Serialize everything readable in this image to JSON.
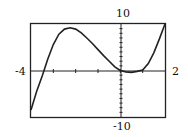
{
  "chart_data": {
    "type": "line",
    "title": "",
    "xlabel": "",
    "ylabel": "",
    "xlim": [
      -4,
      2
    ],
    "ylim": [
      -10,
      10
    ],
    "tick_labels": {
      "x_min": "-4",
      "x_max": "2",
      "y_max": "10",
      "y_min": "-10"
    },
    "grid": false,
    "series": [
      {
        "name": "f(x)",
        "x": [
          -4,
          -3.75,
          -3.5,
          -3.25,
          -3,
          -2.75,
          -2.5,
          -2.25,
          -2,
          -1.75,
          -1.5,
          -1.25,
          -1,
          -0.75,
          -0.5,
          -0.25,
          0,
          0.25,
          0.5,
          0.75,
          1,
          1.25,
          1.5,
          1.75,
          2
        ],
        "y": [
          -8.5,
          -4.5,
          -1.2,
          2.5,
          5.6,
          7.8,
          8.9,
          9.2,
          8.9,
          8.1,
          7.0,
          5.8,
          4.5,
          3.2,
          2.0,
          0.8,
          0.0,
          -0.3,
          -0.4,
          -0.2,
          0.1,
          1.5,
          3.8,
          6.8,
          10.0
        ]
      }
    ]
  }
}
